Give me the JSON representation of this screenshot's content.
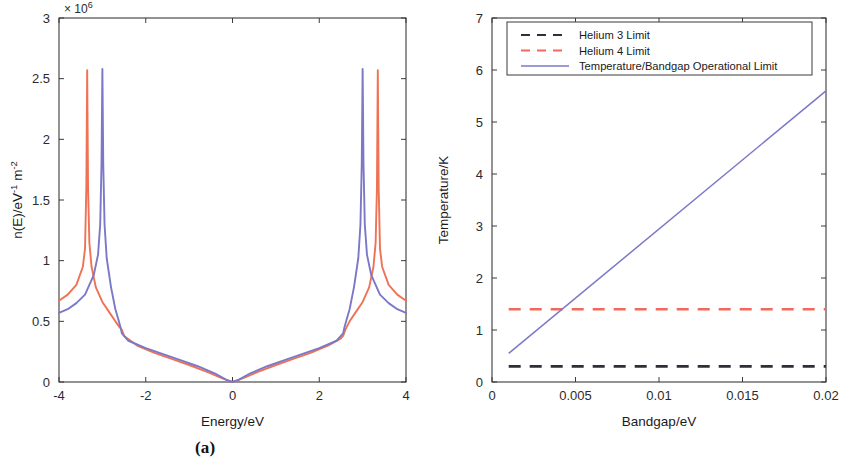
{
  "figure": {
    "panels": [
      {
        "caption": "(a)",
        "exponent_label": "× 10",
        "exponent_sup": "6"
      },
      {
        "caption": "(b)"
      }
    ]
  },
  "colors": {
    "series_blue": "#7b78c8",
    "series_red": "#ef7254",
    "helium3_black": "#2f2f3a",
    "helium4_red": "#f2685c",
    "axis": "#3a3a3a",
    "text": "#1a1a1a"
  },
  "chart_data": [
    {
      "type": "line",
      "panel": "(a)",
      "title": "",
      "xlabel": "Energy/eV",
      "ylabel": "n(E)/eV",
      "ylabel_sup1": "-1",
      "ylabel_mid": " m",
      "ylabel_sup2": "-2",
      "y_exponent_text": "× 10",
      "y_exponent_power": "6",
      "xlim": [
        -4,
        4
      ],
      "ylim": [
        0,
        3
      ],
      "xticks": [
        "-4",
        "-2",
        "0",
        "2",
        "4"
      ],
      "xtick_values": [
        -4,
        -2,
        0,
        2,
        4
      ],
      "yticks": [
        "0",
        "0.5",
        "1",
        "1.5",
        "2",
        "2.5",
        "3"
      ],
      "ytick_values": [
        0,
        0.5,
        1,
        1.5,
        2,
        2.5,
        3
      ],
      "grid": false,
      "legend": "none",
      "note": "Graphene-like density of states: V-shaped near E=0 with van Hove singularity peaks. Values in units of 1e6 eV^-1 m^-2.",
      "series": [
        {
          "name": "red-curve",
          "color": "#ef7254",
          "peak_energies": [
            -3.35,
            3.35
          ],
          "peak_value": 2.57,
          "edge_values": [
            0.67,
            0.67
          ],
          "x": [
            -4.0,
            -3.8,
            -3.6,
            -3.45,
            -3.4,
            -3.37,
            -3.35,
            -3.33,
            -3.3,
            -3.25,
            -3.15,
            -3.0,
            -2.85,
            -2.7,
            -2.6,
            -2.55,
            -2.5,
            -2.2,
            -1.8,
            -1.4,
            -1.0,
            -0.6,
            -0.3,
            -0.1,
            0.0,
            0.1,
            0.3,
            0.6,
            1.0,
            1.4,
            1.8,
            2.2,
            2.5,
            2.55,
            2.6,
            2.7,
            2.85,
            3.0,
            3.15,
            3.25,
            3.3,
            3.33,
            3.35,
            3.37,
            3.4,
            3.45,
            3.6,
            3.8,
            4.0
          ],
          "y": [
            0.67,
            0.72,
            0.8,
            0.95,
            1.1,
            1.6,
            2.57,
            1.6,
            1.15,
            0.95,
            0.78,
            0.66,
            0.58,
            0.5,
            0.45,
            0.43,
            0.38,
            0.3,
            0.24,
            0.19,
            0.14,
            0.085,
            0.04,
            0.012,
            0.0,
            0.012,
            0.04,
            0.085,
            0.14,
            0.19,
            0.24,
            0.3,
            0.36,
            0.38,
            0.43,
            0.5,
            0.58,
            0.66,
            0.78,
            0.95,
            1.15,
            1.6,
            2.57,
            1.6,
            1.1,
            0.95,
            0.8,
            0.72,
            0.67
          ]
        },
        {
          "name": "blue-curve",
          "color": "#7b78c8",
          "peak_energies": [
            -3.0,
            3.0
          ],
          "peak_value": 2.58,
          "edge_values": [
            0.57,
            0.57
          ],
          "x": [
            -4.0,
            -3.8,
            -3.6,
            -3.4,
            -3.2,
            -3.1,
            -3.05,
            -3.02,
            -3.0,
            -2.98,
            -2.95,
            -2.9,
            -2.8,
            -2.7,
            -2.62,
            -2.58,
            -2.55,
            -2.4,
            -2.0,
            -1.6,
            -1.2,
            -0.8,
            -0.4,
            -0.15,
            0.0,
            0.15,
            0.4,
            0.8,
            1.2,
            1.6,
            2.0,
            2.4,
            2.55,
            2.58,
            2.62,
            2.7,
            2.8,
            2.9,
            2.95,
            2.98,
            3.0,
            3.02,
            3.05,
            3.1,
            3.2,
            3.4,
            3.6,
            3.8,
            4.0
          ],
          "y": [
            0.57,
            0.6,
            0.65,
            0.72,
            0.88,
            1.05,
            1.3,
            1.8,
            2.58,
            1.8,
            1.3,
            1.02,
            0.78,
            0.6,
            0.5,
            0.45,
            0.4,
            0.34,
            0.28,
            0.23,
            0.18,
            0.13,
            0.07,
            0.02,
            0.0,
            0.02,
            0.07,
            0.13,
            0.18,
            0.23,
            0.28,
            0.34,
            0.4,
            0.45,
            0.5,
            0.6,
            0.78,
            1.02,
            1.3,
            1.8,
            2.58,
            1.8,
            1.3,
            1.05,
            0.88,
            0.72,
            0.65,
            0.6,
            0.57
          ]
        }
      ]
    },
    {
      "type": "line",
      "panel": "(b)",
      "title": "",
      "xlabel": "Bandgap/eV",
      "ylabel": "Temperature/K",
      "xlim": [
        0,
        0.02
      ],
      "ylim": [
        0,
        7
      ],
      "xticks": [
        "0",
        "0.005",
        "0.01",
        "0.015",
        "0.02"
      ],
      "xtick_values": [
        0,
        0.005,
        0.01,
        0.015,
        0.02
      ],
      "yticks": [
        "0",
        "1",
        "2",
        "3",
        "4",
        "5",
        "6",
        "7"
      ],
      "ytick_values": [
        0,
        1,
        2,
        3,
        4,
        5,
        6,
        7
      ],
      "grid": false,
      "legend": "upper-center",
      "legend_entries": [
        {
          "label": "Helium 3 Limit",
          "color": "#2f2f3a",
          "style": "dashed"
        },
        {
          "label": "Helium 4 Limit",
          "color": "#f2685c",
          "style": "dashed"
        },
        {
          "label": "Temperature/Bandgap Operational Limit",
          "color": "#7b78c8",
          "style": "solid"
        }
      ],
      "series": [
        {
          "name": "Helium 3 Limit",
          "color": "#2f2f3a",
          "style": "dashed",
          "constant_y": 0.3,
          "x": [
            0.001,
            0.02
          ],
          "y": [
            0.3,
            0.3
          ]
        },
        {
          "name": "Helium 4 Limit",
          "color": "#f2685c",
          "style": "dashed",
          "constant_y": 1.4,
          "x": [
            0.001,
            0.02
          ],
          "y": [
            1.4,
            1.4
          ]
        },
        {
          "name": "Temperature/Bandgap Operational Limit",
          "color": "#7b78c8",
          "style": "solid",
          "x": [
            0.001,
            0.02
          ],
          "y": [
            0.55,
            5.6
          ]
        }
      ]
    }
  ]
}
